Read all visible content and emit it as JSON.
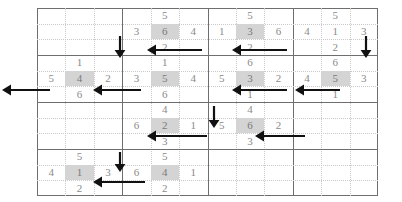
{
  "puzzle": {
    "title": "number-maze-grid",
    "grid": {
      "block_cols": 4,
      "block_rows": 4,
      "sub_cols": 3,
      "sub_rows": 3,
      "left": 37,
      "top": 8,
      "width": 341,
      "height": 188,
      "major_line_color": "#6e6e6e",
      "minor_line_color": "#c9c9c9",
      "highlight_color": "#d4d4d4",
      "number_color": "#8a8a8a",
      "arrow_color": "#111111"
    },
    "numbers": [
      {
        "block_r": 0,
        "block_c": 1,
        "sub_r": 0,
        "sub_c": 1,
        "value": "5",
        "highlight": false
      },
      {
        "block_r": 0,
        "block_c": 1,
        "sub_r": 1,
        "sub_c": 0,
        "value": "3",
        "highlight": false
      },
      {
        "block_r": 0,
        "block_c": 1,
        "sub_r": 1,
        "sub_c": 1,
        "value": "6",
        "highlight": true
      },
      {
        "block_r": 0,
        "block_c": 1,
        "sub_r": 1,
        "sub_c": 2,
        "value": "4",
        "highlight": false
      },
      {
        "block_r": 0,
        "block_c": 1,
        "sub_r": 2,
        "sub_c": 1,
        "value": "2",
        "highlight": false
      },
      {
        "block_r": 0,
        "block_c": 2,
        "sub_r": 0,
        "sub_c": 1,
        "value": "5",
        "highlight": false
      },
      {
        "block_r": 0,
        "block_c": 2,
        "sub_r": 1,
        "sub_c": 0,
        "value": "1",
        "highlight": false
      },
      {
        "block_r": 0,
        "block_c": 2,
        "sub_r": 1,
        "sub_c": 1,
        "value": "3",
        "highlight": true
      },
      {
        "block_r": 0,
        "block_c": 2,
        "sub_r": 1,
        "sub_c": 2,
        "value": "6",
        "highlight": false
      },
      {
        "block_r": 0,
        "block_c": 2,
        "sub_r": 2,
        "sub_c": 1,
        "value": "2",
        "highlight": false
      },
      {
        "block_r": 0,
        "block_c": 3,
        "sub_r": 0,
        "sub_c": 1,
        "value": "5",
        "highlight": false
      },
      {
        "block_r": 0,
        "block_c": 3,
        "sub_r": 1,
        "sub_c": 0,
        "value": "4",
        "highlight": false
      },
      {
        "block_r": 0,
        "block_c": 3,
        "sub_r": 1,
        "sub_c": 1,
        "value": "1",
        "highlight": false
      },
      {
        "block_r": 0,
        "block_c": 3,
        "sub_r": 1,
        "sub_c": 2,
        "value": "3",
        "highlight": false
      },
      {
        "block_r": 0,
        "block_c": 3,
        "sub_r": 2,
        "sub_c": 1,
        "value": "2",
        "highlight": false
      },
      {
        "block_r": 1,
        "block_c": 0,
        "sub_r": 0,
        "sub_c": 1,
        "value": "1",
        "highlight": false
      },
      {
        "block_r": 1,
        "block_c": 0,
        "sub_r": 1,
        "sub_c": 0,
        "value": "5",
        "highlight": false
      },
      {
        "block_r": 1,
        "block_c": 0,
        "sub_r": 1,
        "sub_c": 1,
        "value": "4",
        "highlight": true
      },
      {
        "block_r": 1,
        "block_c": 0,
        "sub_r": 1,
        "sub_c": 2,
        "value": "2",
        "highlight": false
      },
      {
        "block_r": 1,
        "block_c": 0,
        "sub_r": 2,
        "sub_c": 1,
        "value": "6",
        "highlight": false
      },
      {
        "block_r": 1,
        "block_c": 1,
        "sub_r": 0,
        "sub_c": 1,
        "value": "1",
        "highlight": false
      },
      {
        "block_r": 1,
        "block_c": 1,
        "sub_r": 1,
        "sub_c": 0,
        "value": "3",
        "highlight": false
      },
      {
        "block_r": 1,
        "block_c": 1,
        "sub_r": 1,
        "sub_c": 1,
        "value": "5",
        "highlight": true
      },
      {
        "block_r": 1,
        "block_c": 1,
        "sub_r": 1,
        "sub_c": 2,
        "value": "4",
        "highlight": false
      },
      {
        "block_r": 1,
        "block_c": 1,
        "sub_r": 2,
        "sub_c": 1,
        "value": "6",
        "highlight": false
      },
      {
        "block_r": 1,
        "block_c": 2,
        "sub_r": 0,
        "sub_c": 1,
        "value": "6",
        "highlight": false
      },
      {
        "block_r": 1,
        "block_c": 2,
        "sub_r": 1,
        "sub_c": 0,
        "value": "5",
        "highlight": false
      },
      {
        "block_r": 1,
        "block_c": 2,
        "sub_r": 1,
        "sub_c": 1,
        "value": "3",
        "highlight": true
      },
      {
        "block_r": 1,
        "block_c": 2,
        "sub_r": 1,
        "sub_c": 2,
        "value": "2",
        "highlight": false
      },
      {
        "block_r": 1,
        "block_c": 2,
        "sub_r": 2,
        "sub_c": 1,
        "value": "1",
        "highlight": false
      },
      {
        "block_r": 1,
        "block_c": 3,
        "sub_r": 0,
        "sub_c": 1,
        "value": "6",
        "highlight": false
      },
      {
        "block_r": 1,
        "block_c": 3,
        "sub_r": 1,
        "sub_c": 0,
        "value": "4",
        "highlight": false
      },
      {
        "block_r": 1,
        "block_c": 3,
        "sub_r": 1,
        "sub_c": 1,
        "value": "5",
        "highlight": true
      },
      {
        "block_r": 1,
        "block_c": 3,
        "sub_r": 1,
        "sub_c": 2,
        "value": "3",
        "highlight": false
      },
      {
        "block_r": 1,
        "block_c": 3,
        "sub_r": 2,
        "sub_c": 1,
        "value": "1",
        "highlight": false
      },
      {
        "block_r": 2,
        "block_c": 1,
        "sub_r": 0,
        "sub_c": 1,
        "value": "4",
        "highlight": false
      },
      {
        "block_r": 2,
        "block_c": 1,
        "sub_r": 1,
        "sub_c": 0,
        "value": "6",
        "highlight": false
      },
      {
        "block_r": 2,
        "block_c": 1,
        "sub_r": 1,
        "sub_c": 1,
        "value": "2",
        "highlight": true
      },
      {
        "block_r": 2,
        "block_c": 1,
        "sub_r": 1,
        "sub_c": 2,
        "value": "1",
        "highlight": false
      },
      {
        "block_r": 2,
        "block_c": 1,
        "sub_r": 2,
        "sub_c": 1,
        "value": "3",
        "highlight": false
      },
      {
        "block_r": 2,
        "block_c": 2,
        "sub_r": 0,
        "sub_c": 1,
        "value": "4",
        "highlight": false
      },
      {
        "block_r": 2,
        "block_c": 2,
        "sub_r": 1,
        "sub_c": 0,
        "value": "5",
        "highlight": false
      },
      {
        "block_r": 2,
        "block_c": 2,
        "sub_r": 1,
        "sub_c": 1,
        "value": "6",
        "highlight": true
      },
      {
        "block_r": 2,
        "block_c": 2,
        "sub_r": 1,
        "sub_c": 2,
        "value": "2",
        "highlight": false
      },
      {
        "block_r": 2,
        "block_c": 2,
        "sub_r": 2,
        "sub_c": 1,
        "value": "3",
        "highlight": false
      },
      {
        "block_r": 3,
        "block_c": 0,
        "sub_r": 0,
        "sub_c": 1,
        "value": "5",
        "highlight": false
      },
      {
        "block_r": 3,
        "block_c": 0,
        "sub_r": 1,
        "sub_c": 0,
        "value": "4",
        "highlight": false
      },
      {
        "block_r": 3,
        "block_c": 0,
        "sub_r": 1,
        "sub_c": 1,
        "value": "1",
        "highlight": true
      },
      {
        "block_r": 3,
        "block_c": 0,
        "sub_r": 1,
        "sub_c": 2,
        "value": "3",
        "highlight": false
      },
      {
        "block_r": 3,
        "block_c": 0,
        "sub_r": 2,
        "sub_c": 1,
        "value": "2",
        "highlight": false
      },
      {
        "block_r": 3,
        "block_c": 1,
        "sub_r": 0,
        "sub_c": 1,
        "value": "5",
        "highlight": false
      },
      {
        "block_r": 3,
        "block_c": 1,
        "sub_r": 1,
        "sub_c": 0,
        "value": "6",
        "highlight": false
      },
      {
        "block_r": 3,
        "block_c": 1,
        "sub_r": 1,
        "sub_c": 1,
        "value": "4",
        "highlight": true
      },
      {
        "block_r": 3,
        "block_c": 1,
        "sub_r": 1,
        "sub_c": 2,
        "value": "1",
        "highlight": false
      },
      {
        "block_r": 3,
        "block_c": 1,
        "sub_r": 2,
        "sub_c": 1,
        "value": "2",
        "highlight": false
      }
    ],
    "arrows": [
      {
        "id": "arrow-down-b0c1",
        "dir": "down",
        "x": 120,
        "y": 36,
        "len": 22
      },
      {
        "id": "arrow-down-b0c3",
        "dir": "down",
        "x": 366,
        "y": 36,
        "len": 22
      },
      {
        "id": "arrow-down-b1c2",
        "dir": "down",
        "x": 214,
        "y": 106,
        "len": 22
      },
      {
        "id": "arrow-down-b2c1",
        "dir": "down",
        "x": 120,
        "y": 152,
        "len": 20
      },
      {
        "id": "arrow-left-r0a",
        "dir": "left",
        "x": 147,
        "y": 50,
        "len": 55
      },
      {
        "id": "arrow-left-r0b",
        "dir": "left",
        "x": 232,
        "y": 50,
        "len": 55
      },
      {
        "id": "arrow-left-r1a",
        "dir": "left",
        "x": 2,
        "y": 90,
        "len": 48
      },
      {
        "id": "arrow-left-r1b",
        "dir": "left",
        "x": 93,
        "y": 90,
        "len": 48
      },
      {
        "id": "arrow-left-r1c",
        "dir": "left",
        "x": 232,
        "y": 90,
        "len": 55
      },
      {
        "id": "arrow-left-r1d",
        "dir": "left",
        "x": 295,
        "y": 90,
        "len": 45
      },
      {
        "id": "arrow-left-r2a",
        "dir": "left",
        "x": 147,
        "y": 136,
        "len": 60
      },
      {
        "id": "arrow-left-r2b",
        "dir": "left",
        "x": 255,
        "y": 136,
        "len": 50
      },
      {
        "id": "arrow-left-r3a",
        "dir": "left",
        "x": 93,
        "y": 182,
        "len": 52
      }
    ]
  }
}
